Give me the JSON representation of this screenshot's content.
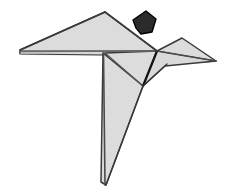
{
  "image": {
    "title": "Origami paper crane / bird figure",
    "width": 229,
    "height": 195,
    "background_color": "#ffffff",
    "alt_text": "A folded paper origami bird shown in light grey with dark outlines and a small dark pentagonal cursor above its head"
  },
  "palette": {
    "paper_fill": "#dcdcdc",
    "paper_fill_light": "#e2e2e2",
    "paper_fill_shadow": "#d2d2d2",
    "outline": "#3a3a3a",
    "fold_line": "#555555",
    "fold_line_strong": "#1c1c1c",
    "cursor_fill": "#2b2b2b",
    "cursor_outline": "#000000",
    "white": "#ffffff"
  },
  "parts": [
    {
      "id": "left-wing",
      "label": "Left wing",
      "fill": "#dcdcdc",
      "points": "20,50 105,12 157,51 20,53"
    },
    {
      "id": "wing-underside",
      "label": "Wing underside panel",
      "fill": "#d7d7d7",
      "points": "20,50 157,51 105,53"
    },
    {
      "id": "right-wing",
      "label": "Right wing",
      "fill": "#dcdcdc",
      "points": "157,51 182,38 216,61 163,63"
    },
    {
      "id": "head-beak",
      "label": "Head and beak",
      "fill": "#d9d9d9",
      "points": "157,51 216,61 164,66 143,86"
    },
    {
      "id": "neck-panel",
      "label": "Neck panel",
      "fill": "#dcdcdc",
      "points": "105,53 157,51 143,86 119,74"
    },
    {
      "id": "body",
      "label": "Body",
      "fill": "#dcdcdc",
      "points": "104,53 143,86 105,185"
    },
    {
      "id": "tail",
      "label": "Tail point",
      "fill": "#d6d6d6",
      "points": "104,53 105,185 101,183"
    }
  ],
  "fold_lines": [
    {
      "id": "fold-wing-spine",
      "label": "Wing spine fold",
      "from": "20,51",
      "to": "157,51",
      "weight": 1.6,
      "color": "#6a6a6a"
    },
    {
      "id": "fold-body-left",
      "label": "Body left fold",
      "from": "104,53",
      "to": "105,185",
      "weight": 1.6,
      "color": "#4a4a4a"
    },
    {
      "id": "fold-neck-diagonal",
      "label": "Neck diagonal fold",
      "from": "105,53",
      "to": "143,86",
      "weight": 1.3,
      "color": "#555555"
    },
    {
      "id": "fold-neck-vertical",
      "label": "Neck crease",
      "from": "157,51",
      "to": "143,86",
      "weight": 2.2,
      "color": "#141414"
    },
    {
      "id": "fold-head-edge",
      "label": "Head lower edge",
      "from": "143,86",
      "to": "167,64",
      "weight": 1.4,
      "color": "#3a3a3a"
    },
    {
      "id": "fold-wing-inner",
      "label": "Right wing inner fold",
      "from": "157,51",
      "to": "216,61",
      "weight": 1.2,
      "color": "#4e4e4e"
    },
    {
      "id": "fold-body-diagonal",
      "label": "Body diagonal",
      "from": "143,86",
      "to": "105,185",
      "weight": 1.4,
      "color": "#3a3a3a"
    }
  ],
  "cursor": {
    "id": "pointer-cursor",
    "label": "Pointer cursor",
    "fill": "#2b2b2b",
    "outline": "#000000",
    "points": "133,20 146,11 156,19 152,32 141,34 136,28"
  }
}
